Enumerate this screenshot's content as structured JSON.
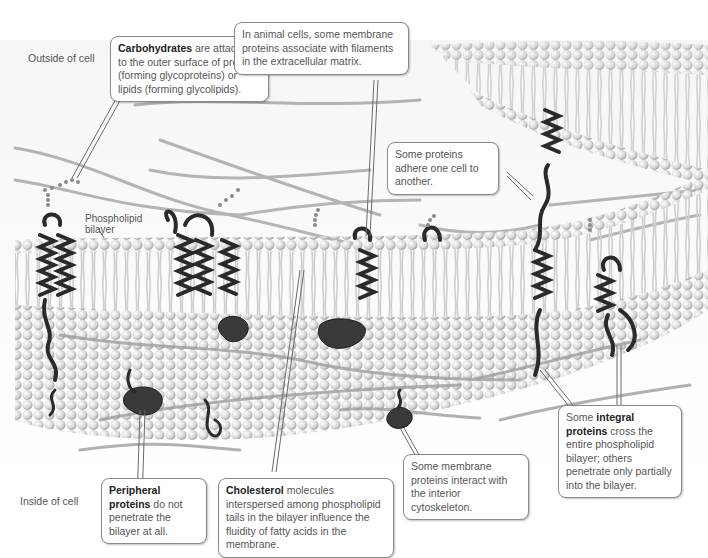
{
  "figure": {
    "regions": {
      "outside": "Outside of cell",
      "inside": "Inside of cell"
    },
    "labels": {
      "bilayer_line1": "Phospholipid",
      "bilayer_line2": "bilayer"
    },
    "callouts": {
      "carbohydrates": {
        "bold": "Carbohydrates",
        "text": " are attached to the outer surface of proteins (forming glycoproteins) or lipids (forming glycolipids)."
      },
      "ecm": {
        "text": "In animal cells, some membrane proteins associate with filaments in the extracellular matrix."
      },
      "adhere": {
        "text": "Some proteins adhere one cell to another."
      },
      "integral": {
        "pre": "Some ",
        "bold": "integral proteins",
        "text": " cross the entire phospholipid bilayer; others penetrate only partially into the bilayer."
      },
      "cytoskeleton": {
        "text": "Some membrane proteins interact with the interior cytoskeleton."
      },
      "peripheral": {
        "bold": "Peripheral proteins",
        "text": " do not penetrate the bilayer at all."
      },
      "cholesterol": {
        "bold": "Cholesterol",
        "text": " molecules interspersed among phospholipid tails in the bilayer influence the fluidity of fatty acids in the membrane."
      }
    },
    "colors": {
      "background": "#ffffff",
      "phospholipid_head": "#d8d8d8",
      "protein": "#2a2a2a",
      "filament": "#9a9a9a",
      "callout_border": "#8a8a8a",
      "text": "#555555"
    }
  }
}
